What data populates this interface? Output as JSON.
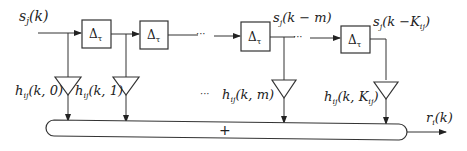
{
  "diagram": {
    "input_label": {
      "base": "s",
      "sub": "j",
      "arg": "(k)"
    },
    "delay_label": {
      "base": "Δ",
      "sub": "τ"
    },
    "mid_tap_label": {
      "base": "s",
      "sub": "j",
      "arg": "(k − m)"
    },
    "last_tap_label": {
      "base": "s",
      "sub": "j",
      "arg": "(k −K",
      "arg_sub": "ij",
      "arg_close": ")"
    },
    "ellipsis": "···",
    "gains": [
      {
        "base": "h",
        "sub": "ij",
        "arg": "(k, 0)"
      },
      {
        "base": "h",
        "sub": "ij",
        "arg": "(k, 1)"
      },
      {
        "base": "h",
        "sub": "ij",
        "arg": "(k, m)"
      },
      {
        "base": "h",
        "sub": "ij",
        "arg": "(k, K",
        "arg_sub": "ij",
        "arg_close": ")"
      }
    ],
    "summer_label": "+",
    "output_label": {
      "base": "r",
      "sub": "i",
      "arg": "(k)"
    },
    "colors": {
      "stroke": "#333333",
      "background": "#ffffff"
    }
  }
}
